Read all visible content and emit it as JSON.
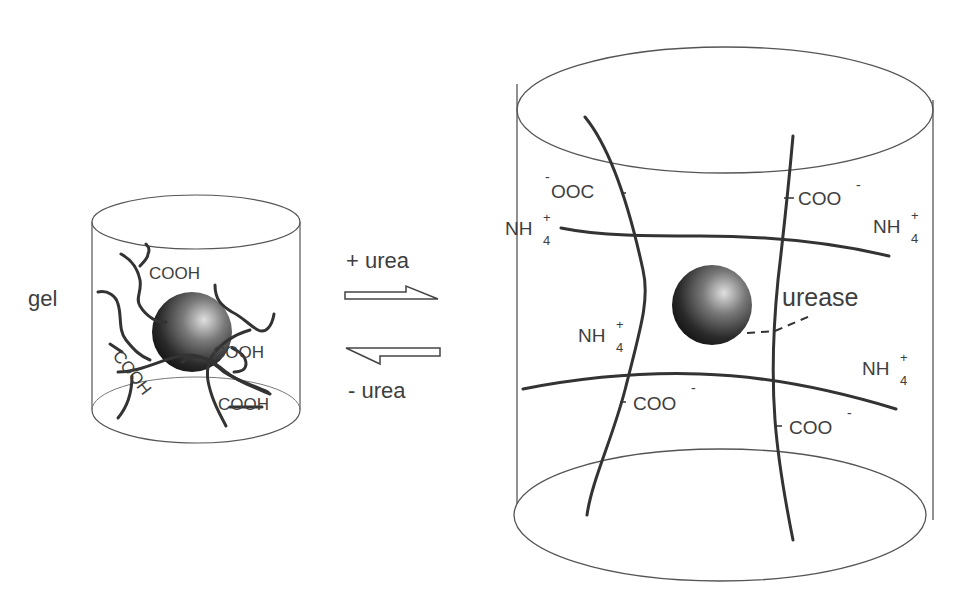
{
  "left_panel": {
    "state_label": "gel",
    "groups": [
      "COOH",
      "COOH",
      "COOH",
      "COOH"
    ]
  },
  "arrows": {
    "forward_label": "+ urea",
    "reverse_label": "- urea"
  },
  "right_panel": {
    "enzyme_label": "urease",
    "ions": {
      "carboxylate_left": "OOC",
      "carboxylate_left_charge": "-",
      "carboxylate": "COO",
      "carboxylate_charge": "-",
      "ammonium": "NH",
      "ammonium_sub": "4",
      "ammonium_sup": "+"
    }
  },
  "colors": {
    "stroke": "#333333",
    "outline": "#555555",
    "sphere_dark": "#1a1a1a",
    "sphere_light": "#d8d8d8"
  }
}
